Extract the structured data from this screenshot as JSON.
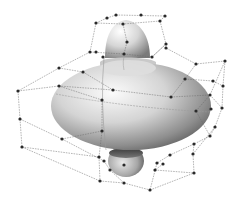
{
  "figure": {
    "title": "",
    "colors": {
      "background": "#ffffff",
      "surface_light": "#f4f4f4",
      "surface_mid": "#bdbdbd",
      "surface_dark": "#4a4a4a",
      "lattice": "#6a6a6a",
      "points": "#2a2a2a"
    }
  },
  "control_points": [
    [
      96,
      23
    ],
    [
      107,
      18
    ],
    [
      116,
      15
    ],
    [
      141,
      15
    ],
    [
      165,
      16
    ],
    [
      160,
      21
    ],
    [
      123,
      24
    ],
    [
      127,
      42
    ],
    [
      166,
      44
    ],
    [
      96,
      52
    ],
    [
      90,
      52
    ],
    [
      103,
      57
    ],
    [
      124,
      54
    ],
    [
      152,
      57
    ],
    [
      166,
      48
    ],
    [
      196,
      64
    ],
    [
      225,
      61
    ],
    [
      59,
      68
    ],
    [
      83,
      72
    ],
    [
      185,
      79
    ],
    [
      213,
      81
    ],
    [
      223,
      86
    ],
    [
      18,
      91
    ],
    [
      59,
      86
    ],
    [
      113,
      90
    ],
    [
      171,
      97
    ],
    [
      210,
      95
    ],
    [
      222,
      108
    ],
    [
      102,
      100
    ],
    [
      196,
      111
    ],
    [
      211,
      109
    ],
    [
      20,
      119
    ],
    [
      102,
      131
    ],
    [
      215,
      127
    ],
    [
      210,
      136
    ],
    [
      62,
      139
    ],
    [
      194,
      144
    ],
    [
      193,
      154
    ],
    [
      22,
      147
    ],
    [
      99,
      157
    ],
    [
      104,
      161
    ],
    [
      170,
      155
    ],
    [
      163,
      164
    ],
    [
      110,
      170
    ],
    [
      124,
      165
    ],
    [
      157,
      163
    ],
    [
      155,
      170
    ],
    [
      100,
      181
    ],
    [
      124,
      183
    ],
    [
      150,
      190
    ],
    [
      194,
      173
    ]
  ],
  "lattice_edges": [
    [
      0,
      1
    ],
    [
      1,
      2
    ],
    [
      2,
      4
    ],
    [
      4,
      5
    ],
    [
      5,
      6
    ],
    [
      6,
      0
    ],
    [
      0,
      10
    ],
    [
      6,
      7
    ],
    [
      7,
      12
    ],
    [
      5,
      8
    ],
    [
      8,
      13
    ],
    [
      10,
      12
    ],
    [
      12,
      13
    ],
    [
      13,
      8
    ],
    [
      10,
      17
    ],
    [
      17,
      22
    ],
    [
      22,
      23
    ],
    [
      23,
      24
    ],
    [
      24,
      25
    ],
    [
      25,
      26
    ],
    [
      26,
      16
    ],
    [
      16,
      15
    ],
    [
      15,
      14
    ],
    [
      14,
      8
    ],
    [
      17,
      18
    ],
    [
      18,
      24
    ],
    [
      19,
      20
    ],
    [
      20,
      21
    ],
    [
      15,
      19
    ],
    [
      19,
      25
    ],
    [
      16,
      21
    ],
    [
      21,
      27
    ],
    [
      26,
      27
    ],
    [
      22,
      31
    ],
    [
      31,
      38
    ],
    [
      38,
      39
    ],
    [
      39,
      32
    ],
    [
      32,
      28
    ],
    [
      28,
      23
    ],
    [
      31,
      35
    ],
    [
      35,
      32
    ],
    [
      27,
      33
    ],
    [
      33,
      34
    ],
    [
      34,
      29
    ],
    [
      29,
      26
    ],
    [
      34,
      36
    ],
    [
      36,
      37
    ],
    [
      38,
      47
    ],
    [
      47,
      48
    ],
    [
      48,
      49
    ],
    [
      49,
      50
    ],
    [
      50,
      37
    ],
    [
      37,
      33
    ],
    [
      39,
      47
    ],
    [
      40,
      43
    ],
    [
      43,
      48
    ],
    [
      41,
      45
    ],
    [
      45,
      49
    ],
    [
      42,
      46
    ],
    [
      46,
      50
    ],
    [
      35,
      40
    ],
    [
      36,
      41
    ]
  ]
}
